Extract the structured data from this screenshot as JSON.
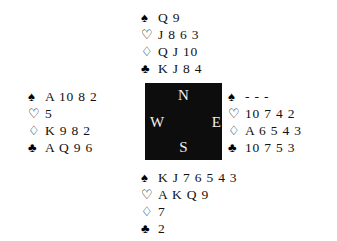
{
  "diagram": {
    "type": "bridge-deal",
    "suit_symbols": {
      "spades": "♠",
      "hearts": "♡",
      "diamonds": "♢",
      "clubs": "♣"
    },
    "compass": {
      "north": "N",
      "south": "S",
      "east": "E",
      "west": "W",
      "box_color": "#0d0d0d",
      "label_color": "#f2f2f2"
    },
    "hands": {
      "north": {
        "seat": "North",
        "spades": "Q 9",
        "hearts": "J 8 6 3",
        "diamonds": "Q J 10",
        "clubs": "K J 8 4"
      },
      "west": {
        "seat": "West",
        "spades": "A 10 8 2",
        "hearts": "5",
        "diamonds": "K 9 8 2",
        "clubs": "A Q 9 6"
      },
      "east": {
        "seat": "East",
        "spades": "- - -",
        "hearts": "10 7 4 2",
        "diamonds": "A 6 5 4 3",
        "clubs": "10 7 5 3"
      },
      "south": {
        "seat": "South",
        "spades": "K J 7 6 5 4 3",
        "hearts": "A K Q 9",
        "diamonds": "7",
        "clubs": "2"
      }
    }
  }
}
